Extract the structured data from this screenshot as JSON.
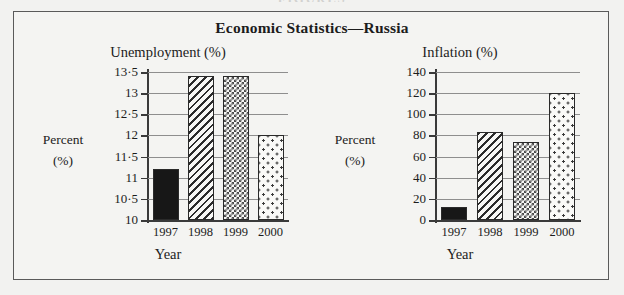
{
  "running_head": "FIGURES",
  "panel": {
    "title": "Economic Statistics—Russia"
  },
  "charts": [
    {
      "subtitle": "Unemployment (%)",
      "ylabel_line1": "Percent",
      "ylabel_line2": "(%)",
      "xlabel": "Year"
    },
    {
      "subtitle": "Inflation (%)",
      "ylabel_line1": "Percent",
      "ylabel_line2": "(%)",
      "xlabel": "Year"
    }
  ],
  "chart_data": [
    {
      "type": "bar",
      "title": "Unemployment (%)",
      "xlabel": "Year",
      "ylabel": "Percent (%)",
      "categories": [
        "1997",
        "1998",
        "1999",
        "2000"
      ],
      "values": [
        11.2,
        13.4,
        13.4,
        12.0
      ],
      "ylim": [
        10,
        13.5
      ],
      "ytick_values": [
        10,
        10.5,
        11,
        11.5,
        12,
        12.5,
        13,
        13.5
      ],
      "ytick_labels": [
        "10",
        "10·5",
        "11",
        "11·5",
        "12",
        "12·5",
        "13",
        "13·5"
      ],
      "bar_patterns": [
        "solid-black",
        "diagonal-hatch",
        "checkered",
        "dotted"
      ],
      "grid": true,
      "legend": "none"
    },
    {
      "type": "bar",
      "title": "Inflation (%)",
      "xlabel": "Year",
      "ylabel": "Percent (%)",
      "categories": [
        "1997",
        "1998",
        "1999",
        "2000"
      ],
      "values": [
        12,
        83,
        74,
        120
      ],
      "ylim": [
        0,
        140
      ],
      "ytick_values": [
        0,
        20,
        40,
        60,
        80,
        100,
        120,
        140
      ],
      "ytick_labels": [
        "0",
        "20",
        "40",
        "60",
        "80",
        "100",
        "120",
        "140"
      ],
      "bar_patterns": [
        "solid-black",
        "diagonal-hatch",
        "checkered",
        "dotted"
      ],
      "grid": true,
      "legend": "none"
    }
  ],
  "colors": {
    "background": "#f2f2f0",
    "panel_border": "#5a5a5a",
    "axis": "#3a3a3a",
    "gridline": "#8e8e8e",
    "bar_solid": "#171717"
  }
}
